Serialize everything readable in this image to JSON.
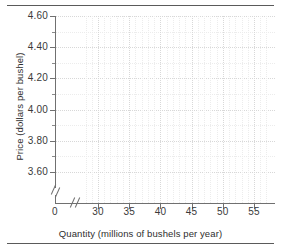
{
  "chart_data": {
    "type": "line",
    "title": "",
    "subtitle": "",
    "xlabel": "Quantity (millions of bushels per year)",
    "ylabel": "Price (dollars per bushel)",
    "xlim": [
      0,
      57.5
    ],
    "ylim": [
      3.5,
      4.6
    ],
    "x_ticks": [
      {
        "value": 0,
        "label": "0"
      },
      {
        "value": 30,
        "label": "30"
      },
      {
        "value": 35,
        "label": "35"
      },
      {
        "value": 40,
        "label": "40"
      },
      {
        "value": 45,
        "label": "45"
      },
      {
        "value": 50,
        "label": "50"
      },
      {
        "value": 55,
        "label": "55"
      }
    ],
    "y_ticks": [
      {
        "value": 4.6,
        "label": "4.60"
      },
      {
        "value": 4.4,
        "label": "4.40"
      },
      {
        "value": 4.2,
        "label": "4.20"
      },
      {
        "value": 4.0,
        "label": "4.00"
      },
      {
        "value": 3.8,
        "label": "3.80"
      },
      {
        "value": 3.6,
        "label": "3.60"
      }
    ],
    "y_minor_ticks": [
      4.5,
      4.3,
      4.1,
      3.9,
      3.7
    ],
    "grid": true,
    "grid_style": "dotted",
    "grid_color": "#d8d8d8",
    "legend": null,
    "series": [],
    "values": [],
    "categories": [],
    "annotations": [
      {
        "name": "y-axis-break",
        "description": "double-slash break mark on vertical axis below 3.60"
      },
      {
        "name": "x-axis-break",
        "description": "double-slash break mark on horizontal axis between 0 and 30"
      }
    ]
  },
  "figure": {
    "y_axis_title": "Price (dollars per bushel)",
    "x_axis_title": "Quantity (millions of bushels per year)",
    "y_tick_labels": [
      "4.60",
      "4.40",
      "4.20",
      "4.00",
      "3.80",
      "3.60"
    ],
    "x_tick_labels": [
      "0",
      "30",
      "35",
      "40",
      "45",
      "50",
      "55"
    ],
    "colors": {
      "rule": "#5a5a5a",
      "axis": "#707070",
      "grid_major": "#d8d8d8",
      "grid_minor": "#ececec",
      "text": "#2e2e2e",
      "background": "#ffffff"
    }
  }
}
